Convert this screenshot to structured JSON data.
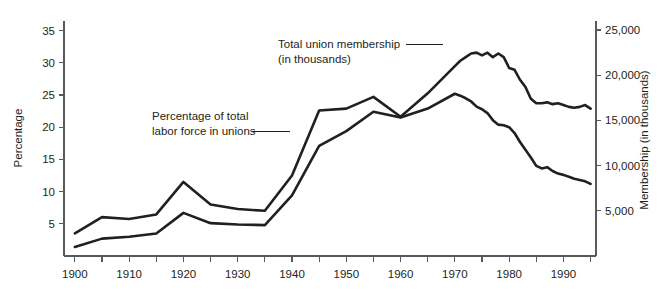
{
  "chart_data": {
    "type": "line",
    "title": "",
    "xlabel": "",
    "grid": false,
    "legend_position": "inline-annotations",
    "x": [
      1900,
      1905,
      1910,
      1915,
      1920,
      1925,
      1930,
      1935,
      1940,
      1945,
      1950,
      1955,
      1960,
      1965,
      1970,
      1971,
      1972,
      1973,
      1974,
      1975,
      1976,
      1977,
      1978,
      1979,
      1980,
      1981,
      1982,
      1983,
      1984,
      1985,
      1986,
      1987,
      1988,
      1989,
      1990,
      1991,
      1992,
      1993,
      1994,
      1995
    ],
    "xlim": [
      1898,
      1996
    ],
    "xticks_labeled": [
      "1900",
      "1910",
      "1920",
      "1930",
      "1940",
      "1950",
      "1960",
      "1970",
      "1980",
      "1990"
    ],
    "xticks_labeled_values": [
      1900,
      1910,
      1920,
      1930,
      1940,
      1950,
      1960,
      1970,
      1980,
      1990
    ],
    "xticks_minor_values": [
      1905,
      1915,
      1925,
      1935,
      1945,
      1955,
      1965,
      1975,
      1985,
      1995
    ],
    "left_axis": {
      "label": "Percentage",
      "ticks": [
        "5",
        "10",
        "15",
        "20",
        "25",
        "30",
        "35"
      ],
      "tick_values": [
        5,
        10,
        15,
        20,
        25,
        30,
        35
      ],
      "ylim": [
        0,
        36.5
      ]
    },
    "right_axis": {
      "label": "Membership (in thousands)",
      "ticks": [
        "5,000",
        "10,000",
        "15,000",
        "20,000",
        "25,000"
      ],
      "tick_values": [
        5000,
        10000,
        15000,
        20000,
        25000
      ],
      "ylim": [
        0,
        26000
      ]
    },
    "series": [
      {
        "name": "Total union membership (in thousands)",
        "axis": "right",
        "annotation_line1": "Total union membership",
        "annotation_line2": "(in thousands)",
        "values": [
          2500,
          4300,
          4100,
          4600,
          8200,
          5700,
          5200,
          5000,
          8900,
          16100,
          16300,
          17600,
          15400,
          18000,
          21000,
          21600,
          22000,
          22400,
          22500,
          22200,
          22500,
          22000,
          22400,
          22000,
          20800,
          20600,
          19500,
          18700,
          17400,
          16900,
          16900,
          17000,
          16800,
          16900,
          16700,
          16500,
          16400,
          16500,
          16700,
          16300
        ]
      },
      {
        "name": "Percentage of total labor force in unions",
        "axis": "left",
        "annotation_line1": "Percentage of total",
        "annotation_line2": "labor force in unions",
        "values": [
          1.4,
          2.7,
          3.0,
          3.5,
          6.7,
          5.1,
          4.9,
          4.8,
          9.4,
          17.1,
          19.4,
          22.4,
          21.5,
          22.9,
          25.2,
          24.9,
          24.5,
          24.0,
          23.2,
          22.8,
          22.2,
          21.1,
          20.4,
          20.3,
          20.0,
          19.1,
          17.7,
          16.5,
          15.3,
          14.0,
          13.6,
          13.8,
          13.2,
          12.8,
          12.6,
          12.3,
          12.0,
          11.8,
          11.6,
          11.2
        ]
      }
    ],
    "annotations": [
      {
        "id": "membership-annotation",
        "line1": "Total union membership",
        "line2": "(in thousands)",
        "text_x": 278,
        "text_y": 48,
        "leader_from_x": 406,
        "leader_to_x": 443,
        "leader_y": 47
      },
      {
        "id": "percentage-annotation",
        "line1": "Percentage of total",
        "line2": "labor force in unions",
        "text_x": 152,
        "text_y": 116,
        "leader_from_x": 252,
        "leader_to_x": 290,
        "leader_y": 133
      }
    ],
    "colors": {
      "line": "#231f20",
      "axis": "#58595b",
      "text": "#231f20",
      "background": "#ffffff"
    }
  }
}
